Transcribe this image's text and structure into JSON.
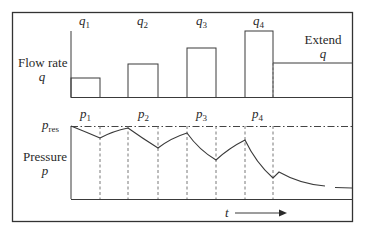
{
  "diagram": {
    "flow_panel": {
      "axis_label": "Flow rate",
      "axis_symbol": "q",
      "bars": [
        {
          "symbol": "q",
          "index": "1"
        },
        {
          "symbol": "q",
          "index": "2"
        },
        {
          "symbol": "q",
          "index": "3"
        },
        {
          "symbol": "q",
          "index": "4"
        }
      ],
      "extend_label": "Extend",
      "extend_symbol": "q"
    },
    "pressure_panel": {
      "axis_label": "Pressure",
      "axis_symbol": "p",
      "reference_symbol": "p",
      "reference_subscript": "res",
      "periods": [
        {
          "symbol": "p",
          "index": "1"
        },
        {
          "symbol": "p",
          "index": "2"
        },
        {
          "symbol": "p",
          "index": "3"
        },
        {
          "symbol": "p",
          "index": "4"
        }
      ]
    },
    "time_axis": {
      "symbol": "t"
    },
    "colors": {
      "line": "#3a3a3a",
      "dashed": "#6a6a6a",
      "frame": "#333333"
    }
  }
}
